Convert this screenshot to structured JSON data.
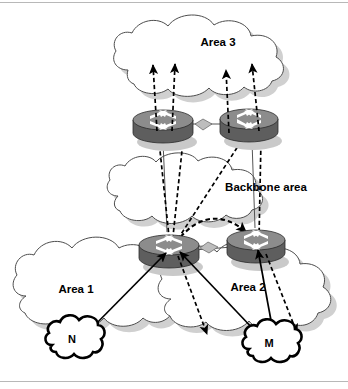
{
  "figure": {
    "type": "network-diagram",
    "width": 348,
    "height": 389,
    "background_color": "#ffffff",
    "border_color": "#b8b8b8"
  },
  "palette": {
    "cloud_outline": "#4d4d4d",
    "cloud_fill": "#ffffff",
    "cloud_shadow": "#d0d0d0",
    "router_body": "#5e5e5e",
    "router_top": "#8c8c8c",
    "router_glyph": "#ffffff",
    "arrow": "#000000",
    "network_outline": "#000000"
  },
  "areas": [
    {
      "id": "area3",
      "label": "Area 3",
      "label_x": 218,
      "label_y": 46,
      "role": "non-backbone"
    },
    {
      "id": "backbone",
      "label": "Backbone area",
      "label_x": 266,
      "label_y": 191,
      "role": "backbone"
    },
    {
      "id": "area1",
      "label": "Area 1",
      "label_x": 76,
      "label_y": 293,
      "role": "non-backbone"
    },
    {
      "id": "area2",
      "label": "Area 2",
      "label_x": 248,
      "label_y": 291,
      "role": "non-backbone"
    }
  ],
  "routers": [
    {
      "id": "abr-top-left",
      "name": "area-border-router-top-left",
      "cx": 163,
      "cy": 125,
      "area_edge": "area3-backbone"
    },
    {
      "id": "abr-top-right",
      "name": "area-border-router-top-right",
      "cx": 249,
      "cy": 124,
      "area_edge": "area3-backbone"
    },
    {
      "id": "abr-bottom-left",
      "name": "area-border-router-bottom-left",
      "cx": 169,
      "cy": 250,
      "area_edge": "area1-backbone"
    },
    {
      "id": "abr-bottom-right",
      "name": "area-border-router-bottom-right",
      "cx": 256,
      "cy": 245,
      "area_edge": "area2-backbone"
    }
  ],
  "networks": [
    {
      "id": "net-n",
      "label": "N",
      "cx": 72,
      "cy": 340,
      "area": "area1"
    },
    {
      "id": "net-m",
      "label": "M",
      "cx": 269,
      "cy": 344,
      "area": "area2"
    }
  ],
  "flows": [
    {
      "id": "f1",
      "style": "solid",
      "from": "net-n",
      "to": "abr-bottom-left",
      "note": "network N advertised to ABR"
    },
    {
      "id": "f2",
      "style": "solid",
      "from": "net-m",
      "to": "abr-bottom-left",
      "note": "network M advertised to ABR"
    },
    {
      "id": "f3",
      "style": "solid",
      "from": "net-m",
      "to": "abr-bottom-right",
      "note": "network M advertised to ABR"
    },
    {
      "id": "f4",
      "style": "dashed",
      "from": "abr-bottom-left",
      "to": "abr-top-left",
      "note": "summary LSA through backbone"
    },
    {
      "id": "f5",
      "style": "dashed",
      "from": "abr-bottom-left",
      "to": "abr-top-left",
      "note": "summary LSA through backbone"
    },
    {
      "id": "f6",
      "style": "dashed",
      "from": "abr-bottom-left",
      "to": "abr-top-right",
      "note": "summary LSA through backbone"
    },
    {
      "id": "f7",
      "style": "dashed",
      "from": "abr-bottom-right",
      "to": "abr-top-right",
      "note": "summary LSA through backbone"
    },
    {
      "id": "f8",
      "style": "dashed",
      "from": "abr-top-left",
      "to": "area3",
      "note": "summary LSA into Area 3"
    },
    {
      "id": "f9",
      "style": "dashed",
      "from": "abr-top-left",
      "to": "area3",
      "note": "summary LSA into Area 3"
    },
    {
      "id": "f10",
      "style": "dashed",
      "from": "abr-top-right",
      "to": "area3",
      "note": "summary LSA into Area 3"
    },
    {
      "id": "f11",
      "style": "dashed",
      "from": "abr-top-right",
      "to": "area3",
      "note": "summary LSA into Area 3"
    },
    {
      "id": "f12",
      "style": "dashed",
      "from": "abr-bottom-left",
      "to": "area2",
      "note": "summary LSA into Area 2"
    },
    {
      "id": "f13",
      "style": "dashed",
      "from": "abr-bottom-right",
      "to": "area2",
      "note": "summary LSA into Area 2"
    },
    {
      "id": "f14",
      "style": "dashed-curve",
      "from": "abr-bottom-left",
      "to": "abr-bottom-right",
      "note": "backbone adjacency"
    }
  ]
}
